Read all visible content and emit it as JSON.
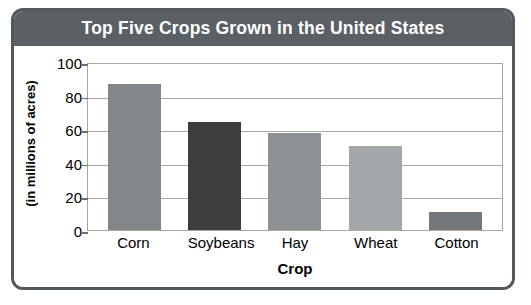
{
  "chart_data": {
    "type": "bar",
    "title": "Top Five Crops Grown in the United States",
    "xlabel": "Crop",
    "ylabel": "(in millions of acres)",
    "categories": [
      "Corn",
      "Soybeans",
      "Hay",
      "Wheat",
      "Cotton"
    ],
    "values": [
      87,
      64,
      58,
      50,
      11
    ],
    "ylim": [
      0,
      100
    ],
    "yticks": [
      0,
      20,
      40,
      60,
      80,
      100
    ],
    "ytick_labels": [
      "0",
      "20",
      "40",
      "60",
      "80",
      "100"
    ],
    "grid": true,
    "legend": "none",
    "bar_colors": [
      "#83878a",
      "#3b3d3f",
      "#8d9194",
      "#a3a7aa",
      "#74787b"
    ]
  },
  "style": {
    "title_bar_color": "#5b6065",
    "title_text_color": "#ffffff",
    "frame_border_color": "#53585c",
    "grid_color": "#a7a7a7",
    "background": "#ffffff"
  }
}
